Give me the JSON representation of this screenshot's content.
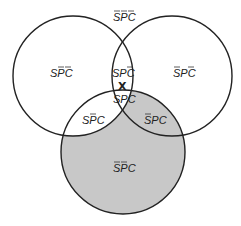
{
  "diagram": {
    "type": "venn-3-set",
    "sets": [
      "S",
      "P",
      "C"
    ],
    "colors": {
      "stroke": "#222222",
      "shade": "#c8c8c8",
      "background": "#ffffff"
    },
    "circles": {
      "S": {
        "cx": 73,
        "cy": 76,
        "r": 60,
        "position": "upper-left"
      },
      "P": {
        "cx": 172,
        "cy": 76,
        "r": 60,
        "position": "upper-right"
      },
      "C": {
        "cx": 123,
        "cy": 152,
        "r": 62,
        "position": "bottom"
      }
    },
    "regions": [
      {
        "id": "outside",
        "label": "SPC",
        "bars": [
          true,
          true,
          true
        ],
        "shaded": false
      },
      {
        "id": "s-only",
        "label": "SPC",
        "bars": [
          false,
          true,
          true
        ],
        "shaded": false
      },
      {
        "id": "s-p",
        "label": "SPC",
        "bars": [
          false,
          false,
          true
        ],
        "shaded": false
      },
      {
        "id": "p-only",
        "label": "SPC",
        "bars": [
          true,
          false,
          true
        ],
        "shaded": false
      },
      {
        "id": "s-p-c",
        "label": "SPC",
        "bars": [
          false,
          false,
          false
        ],
        "shaded": false
      },
      {
        "id": "s-c",
        "label": "SPC",
        "bars": [
          false,
          true,
          false
        ],
        "shaded": false
      },
      {
        "id": "p-c",
        "label": "SPC",
        "bars": [
          true,
          false,
          false
        ],
        "shaded": true
      },
      {
        "id": "c-only",
        "label": "SPC",
        "bars": [
          true,
          true,
          false
        ],
        "shaded": true
      }
    ],
    "marks": [
      {
        "symbol": "X",
        "location": "boundary of C between S∩P region",
        "x": 122,
        "y": 86
      }
    ],
    "shaded_description": "Region of C outside S (S̄PC and S̄P̄C) is shaded"
  }
}
